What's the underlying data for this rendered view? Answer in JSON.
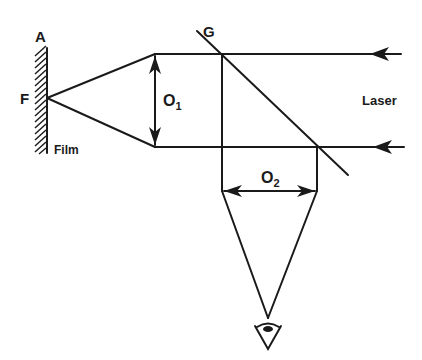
{
  "diagram": {
    "type": "optical-setup",
    "labels": {
      "film_top": "A",
      "focus": "F",
      "film": "Film",
      "beamsplitter": "G",
      "lens1": "O",
      "lens1_sub": "1",
      "lens2": "O",
      "lens2_sub": "2",
      "source": "Laser"
    },
    "elements": [
      {
        "id": "film",
        "label": "Film",
        "top_label": "A"
      },
      {
        "id": "focus-point",
        "label": "F"
      },
      {
        "id": "lens-o1",
        "label": "O1"
      },
      {
        "id": "beamsplitter-g",
        "label": "G"
      },
      {
        "id": "lens-o2",
        "label": "O2"
      },
      {
        "id": "laser-beams",
        "label": "Laser",
        "count": 2,
        "direction": "right-to-left"
      },
      {
        "id": "observer-eye",
        "icon": "eye-icon"
      }
    ],
    "colors": {
      "line": "#1a1a1a",
      "background": "#ffffff"
    }
  }
}
